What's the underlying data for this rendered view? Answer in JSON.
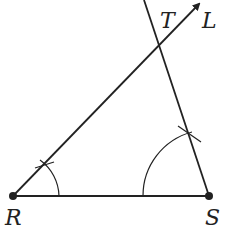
{
  "diagram": {
    "type": "geometric-construction",
    "colors": {
      "stroke": "#222222",
      "background": "#ffffff"
    },
    "points": {
      "R": {
        "label": "R",
        "x": 13,
        "y": 196
      },
      "S": {
        "label": "S",
        "x": 209,
        "y": 196
      },
      "T": {
        "label": "T",
        "x": 158,
        "y": 44
      },
      "L": {
        "label": "L",
        "x": 201,
        "y": 2
      }
    },
    "labels": {
      "R": "R",
      "S": "S",
      "T": "T",
      "L": "L"
    },
    "segments": [
      {
        "from": "R",
        "to": "S",
        "kind": "segment"
      },
      {
        "from": "R",
        "to": "L",
        "kind": "ray-with-arrow"
      },
      {
        "from": "S",
        "through": "T",
        "kind": "line-extended"
      }
    ],
    "arcs": [
      {
        "center": "R",
        "radius": 46,
        "note": "angle arc at R with tick mark on RL"
      },
      {
        "center": "S",
        "radius": 66,
        "note": "angle arc at S with tick mark on ST"
      }
    ]
  }
}
